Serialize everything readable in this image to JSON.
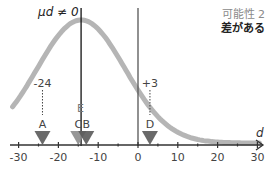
{
  "title_label": "μd ≠ 0",
  "corner": {
    "line1": "可能性 2",
    "line2": "差がある"
  },
  "axis": {
    "label": "d",
    "ticks": [
      -30,
      -20,
      -10,
      0,
      10,
      20,
      30
    ],
    "tick_labels": [
      "-30",
      "-20",
      "-10",
      "0",
      "10",
      "20",
      "30"
    ]
  },
  "markers": [
    {
      "id": "A",
      "value": -24,
      "annotation": "-24",
      "color": "#5a5a5a"
    },
    {
      "id": "C",
      "value": -15,
      "annotation": "",
      "color": "#8c8c8c"
    },
    {
      "id": "B",
      "value": -13,
      "annotation": "",
      "color": "#5a5a5a"
    },
    {
      "id": "D",
      "value": 3,
      "annotation": "+3",
      "color": "#5a5a5a"
    }
  ],
  "mean_label": "E",
  "mean_value": -14.3,
  "colors": {
    "curve": "#b5b5b5",
    "axis": "#333333",
    "mean_line": "#111111",
    "zero_line": "#555555"
  },
  "chart_data": {
    "type": "line",
    "title": "μd ≠ 0",
    "annotation": [
      "可能性 2",
      "差がある"
    ],
    "xlabel": "d",
    "xlim": [
      -30,
      30
    ],
    "x_ticks": [
      -30,
      -20,
      -10,
      0,
      10,
      20,
      30
    ],
    "distribution": {
      "kind": "normal",
      "mean": -14.3,
      "sd": 11
    },
    "points": [
      {
        "label": "A",
        "x": -24
      },
      {
        "label": "C",
        "x": -15
      },
      {
        "label": "B",
        "x": -13
      },
      {
        "label": "D",
        "x": 3
      }
    ],
    "mean_marker": {
      "label": "E",
      "x": -14.3
    },
    "reference_line_x": 0
  }
}
